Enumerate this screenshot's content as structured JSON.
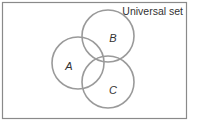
{
  "diagram": {
    "type": "venn",
    "universe_label": "Universal set",
    "sets": [
      {
        "id": "A",
        "label": "A"
      },
      {
        "id": "B",
        "label": "B"
      },
      {
        "id": "C",
        "label": "C"
      }
    ],
    "colors": {
      "frame": "#8a8a8a",
      "circle": "#9a9a9a",
      "text": "#333333"
    }
  }
}
